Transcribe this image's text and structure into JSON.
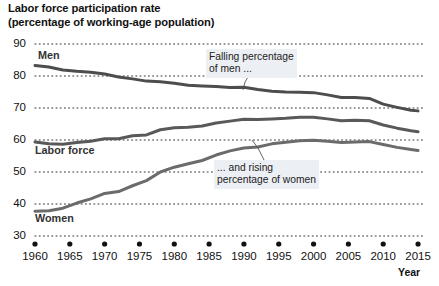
{
  "chart_data": {
    "type": "line",
    "title": "Labor force participation rate",
    "subtitle": "(percentage of working-age population)",
    "xlabel": "Year",
    "ylabel": "",
    "xlim": [
      1960,
      2016
    ],
    "ylim": [
      30,
      90
    ],
    "grid": true,
    "legend_position": "inline-labels",
    "yticks": [
      "90",
      "80",
      "70",
      "60",
      "50",
      "40",
      "30"
    ],
    "ytick_values": [
      90,
      80,
      70,
      60,
      50,
      40,
      30
    ],
    "xticks": [
      "1960",
      "1965",
      "1970",
      "1975",
      "1980",
      "1985",
      "1990",
      "1995",
      "2000",
      "2005",
      "2010",
      "2015"
    ],
    "xtick_values": [
      1960,
      1965,
      1970,
      1975,
      1980,
      1985,
      1990,
      1995,
      2000,
      2005,
      2010,
      2015
    ],
    "series": [
      {
        "name": "Men",
        "color": "#4d4d4d",
        "label": "Men",
        "x": [
          1960,
          1962,
          1964,
          1966,
          1968,
          1970,
          1972,
          1974,
          1976,
          1978,
          1980,
          1982,
          1984,
          1986,
          1988,
          1990,
          1992,
          1994,
          1996,
          1998,
          2000,
          2002,
          2004,
          2006,
          2008,
          2010,
          2012,
          2014,
          2015
        ],
        "values": [
          83.3,
          82.8,
          81.9,
          81.5,
          81.2,
          80.6,
          79.7,
          79.1,
          78.4,
          78.2,
          77.7,
          77.1,
          76.9,
          76.7,
          76.4,
          76.5,
          75.8,
          75.2,
          75.0,
          74.9,
          74.8,
          74.1,
          73.3,
          73.3,
          73.0,
          71.2,
          70.2,
          69.3,
          69.1
        ]
      },
      {
        "name": "Labor force",
        "color": "#595959",
        "label": "Labor force",
        "x": [
          1960,
          1962,
          1964,
          1966,
          1968,
          1970,
          1972,
          1974,
          1976,
          1978,
          1980,
          1982,
          1984,
          1986,
          1988,
          1990,
          1992,
          1994,
          1996,
          1998,
          2000,
          2002,
          2004,
          2006,
          2008,
          2010,
          2012,
          2014,
          2015
        ],
        "values": [
          59.4,
          58.8,
          58.7,
          59.2,
          59.6,
          60.4,
          60.4,
          61.3,
          61.6,
          63.2,
          63.8,
          64.0,
          64.4,
          65.3,
          65.9,
          66.5,
          66.4,
          66.6,
          66.8,
          67.1,
          67.1,
          66.6,
          66.0,
          66.2,
          66.0,
          64.7,
          63.7,
          62.9,
          62.6
        ]
      },
      {
        "name": "Women",
        "color": "#6b6b6b",
        "label": "Women",
        "x": [
          1960,
          1962,
          1964,
          1966,
          1968,
          1970,
          1972,
          1974,
          1976,
          1978,
          1980,
          1982,
          1984,
          1986,
          1988,
          1990,
          1992,
          1994,
          1996,
          1998,
          2000,
          2002,
          2004,
          2006,
          2008,
          2010,
          2012,
          2014,
          2015
        ],
        "values": [
          37.7,
          37.9,
          38.7,
          40.3,
          41.6,
          43.3,
          43.9,
          45.7,
          47.3,
          50.0,
          51.5,
          52.6,
          53.6,
          55.3,
          56.6,
          57.5,
          57.8,
          58.8,
          59.3,
          59.8,
          59.9,
          59.6,
          59.2,
          59.4,
          59.5,
          58.6,
          57.7,
          57.0,
          56.7
        ]
      }
    ],
    "annotations": [
      {
        "id": "men-annotation",
        "line1": "Falling percentage",
        "line2": "of men ...",
        "x": 1988,
        "y": 84.5
      },
      {
        "id": "women-annotation",
        "line1": "... and rising",
        "line2": "percentage of women",
        "x": 1991,
        "y": 43.5
      }
    ]
  }
}
